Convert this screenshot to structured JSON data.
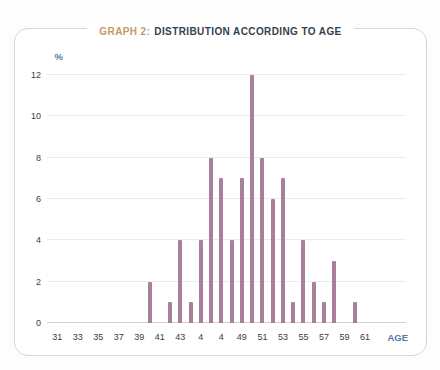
{
  "card": {
    "title_prefix": "GRAPH 2:",
    "title_rest": "DISTRIBUTION ACCORDING TO AGE",
    "title_prefix_color": "#c59a66",
    "title_color": "#33424f",
    "border_color": "#d7d7d7"
  },
  "chart_data": {
    "type": "bar",
    "xlabel": "AGE",
    "ylabel": "%",
    "ylim": [
      0,
      12
    ],
    "y_ticks": [
      0,
      2,
      4,
      6,
      8,
      10,
      12
    ],
    "x_axis_range": [
      30,
      65
    ],
    "x_tick_ages": [
      31,
      33,
      35,
      37,
      39,
      41,
      43,
      45,
      47,
      49,
      51,
      53,
      55,
      57,
      59,
      61
    ],
    "x_tick_labels": [
      "31",
      "33",
      "35",
      "37",
      "39",
      "41",
      "43",
      "4",
      "4",
      "49",
      "51",
      "53",
      "55",
      "57",
      "59",
      "61"
    ],
    "grid": true,
    "legend": "none",
    "bar_color": "#a97f9b",
    "gridline_color": "#ececec",
    "baseline_color": "#d2d2d2",
    "unit_label_color": "#4a7ca8",
    "tick_text_color": "#3c3c3c",
    "points": [
      {
        "age": 40,
        "value": 2
      },
      {
        "age": 42,
        "value": 1
      },
      {
        "age": 43,
        "value": 4
      },
      {
        "age": 44,
        "value": 1
      },
      {
        "age": 45,
        "value": 4
      },
      {
        "age": 46,
        "value": 8
      },
      {
        "age": 47,
        "value": 7
      },
      {
        "age": 48,
        "value": 4
      },
      {
        "age": 49,
        "value": 7
      },
      {
        "age": 50,
        "value": 12
      },
      {
        "age": 51,
        "value": 8
      },
      {
        "age": 52,
        "value": 6
      },
      {
        "age": 53,
        "value": 7
      },
      {
        "age": 54,
        "value": 1
      },
      {
        "age": 55,
        "value": 4
      },
      {
        "age": 56,
        "value": 2
      },
      {
        "age": 57,
        "value": 1
      },
      {
        "age": 58,
        "value": 3
      },
      {
        "age": 60,
        "value": 1
      }
    ]
  }
}
